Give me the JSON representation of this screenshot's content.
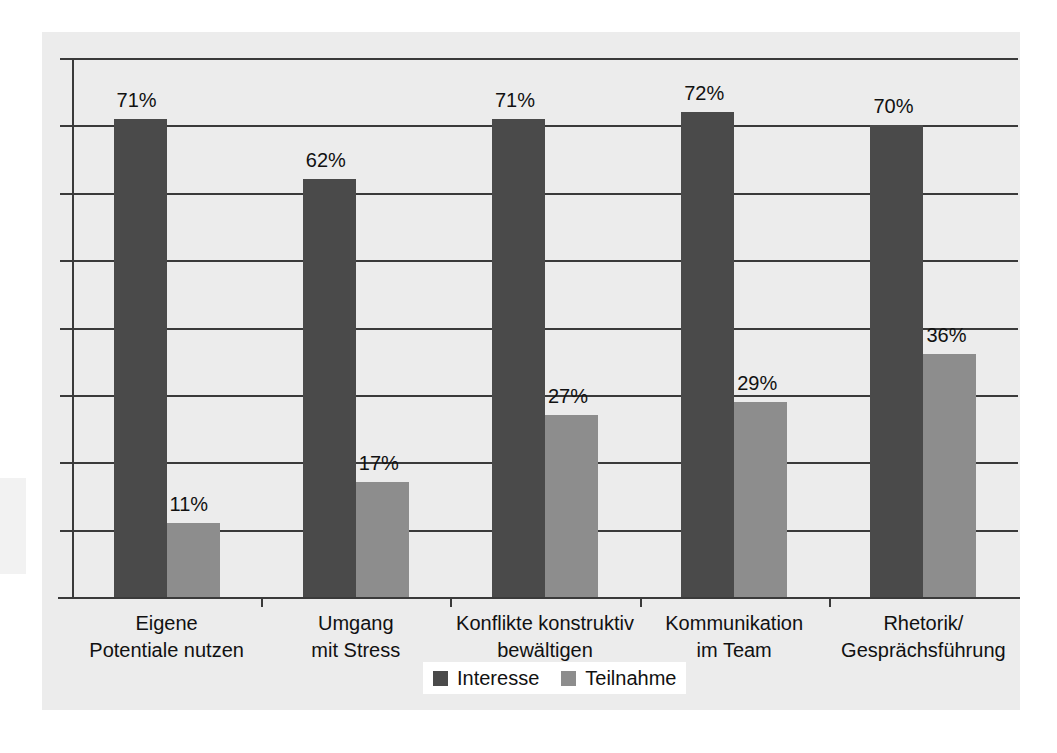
{
  "chart_data": {
    "type": "bar",
    "title": "",
    "subtitle": "",
    "xlabel": "",
    "ylabel": "",
    "ylim": [
      0,
      80
    ],
    "grid": true,
    "grid_step": 10,
    "value_suffix": "%",
    "legend_position": "bottom",
    "categories": [
      "Eigene\nPotentiale nutzen",
      "Umgang\nmit Stress",
      "Konflikte konstruktiv\nbewältigen",
      "Kommunikation\nim Team",
      "Rhetorik/\nGesprächsführung"
    ],
    "category_lines": [
      [
        "Eigene",
        "Potentiale nutzen"
      ],
      [
        "Umgang",
        "mit Stress"
      ],
      [
        "Konflikte konstruktiv",
        "bewältigen"
      ],
      [
        "Kommunikation",
        "im Team"
      ],
      [
        "Rhetorik/",
        "Gesprächsführung"
      ]
    ],
    "series": [
      {
        "name": "Interesse",
        "color": "#4a4a4a",
        "values": [
          71,
          62,
          71,
          72,
          70
        ],
        "labels": [
          "71%",
          "62%",
          "71%",
          "72%",
          "70%"
        ]
      },
      {
        "name": "Teilnahme",
        "color": "#8d8d8d",
        "values": [
          11,
          17,
          27,
          29,
          36
        ],
        "labels": [
          "11%",
          "17%",
          "27%",
          "29%",
          "36%"
        ]
      }
    ]
  },
  "legend": {
    "entries": [
      {
        "label": "Interesse",
        "color": "#4a4a4a"
      },
      {
        "label": "Teilnahme",
        "color": "#8d8d8d"
      }
    ]
  },
  "colors": {
    "panel_background": "#ececec",
    "page_background": "#ffffff",
    "axis": "#3a3a3a",
    "text": "#111111",
    "series_interesse": "#4a4a4a",
    "series_teilnahme": "#8d8d8d"
  }
}
